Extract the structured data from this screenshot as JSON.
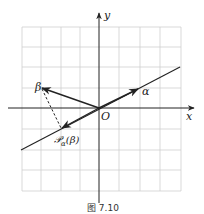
{
  "figure": {
    "caption": "图 7.10",
    "axes": {
      "x_label": "x",
      "y_label": "y",
      "origin_label": "O"
    },
    "vectors": {
      "alpha": {
        "label": "α"
      },
      "beta": {
        "label": "β"
      },
      "projection": {
        "label": "𝒫α(β)",
        "script": "𝒫",
        "subscript": "α",
        "arg": "(β)"
      }
    },
    "colors": {
      "ink": "#222222",
      "grid": "#cfcfcf"
    }
  }
}
